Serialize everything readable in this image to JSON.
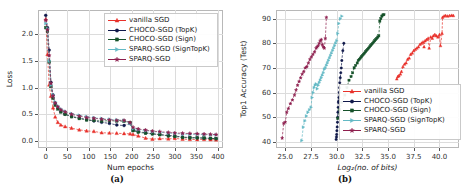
{
  "figure": {
    "panels": [
      {
        "id": "a",
        "caption": "(a)",
        "xlabel": "Num epochs",
        "ylabel": "Loss",
        "xticks": [
          "0",
          "50",
          "100",
          "150",
          "200",
          "250",
          "300",
          "350",
          "400"
        ],
        "yticks": [
          "0.0",
          "0.5",
          "1.0",
          "1.5",
          "2.0"
        ],
        "legend_position": "upper-right"
      },
      {
        "id": "b",
        "caption": "(b)",
        "xlabel": "Log₂(no. of bits)",
        "ylabel": "Top1 Accuracy (Test)",
        "xticks": [
          "25.0",
          "27.5",
          "30.0",
          "32.5",
          "35.0",
          "37.5",
          "40.0"
        ],
        "yticks": [
          "40",
          "50",
          "60",
          "70",
          "80",
          "90"
        ],
        "legend_position": "lower-right"
      }
    ],
    "legend": [
      {
        "label": "vanilla SGD",
        "color": "#e8312a",
        "marker": "triangle-up"
      },
      {
        "label": "CHOCO-SGD (TopK)",
        "color": "#10184a",
        "marker": "circle"
      },
      {
        "label": "CHOCO-SGD (Sign)",
        "color": "#16522a",
        "marker": "square"
      },
      {
        "label": "SPARQ-SGD (SignTopK)",
        "color": "#63b9c4",
        "marker": "triangle-right"
      },
      {
        "label": "SPARQ-SGD",
        "color": "#8e1f4e",
        "marker": "star"
      }
    ]
  },
  "chart_data": [
    {
      "type": "line",
      "panel": "a",
      "title": "",
      "xlabel": "Num epochs",
      "ylabel": "Loss",
      "xlim": [
        -18,
        412
      ],
      "ylim": [
        -0.13,
        2.45
      ],
      "xticks": [
        0,
        50,
        100,
        150,
        200,
        250,
        300,
        350,
        400
      ],
      "yticks": [
        0.0,
        0.5,
        1.0,
        1.5,
        2.0
      ],
      "grid": true,
      "legend_position": "upper right",
      "series": [
        {
          "name": "vanilla SGD",
          "color": "#e8312a",
          "marker": "triangle-up",
          "x": [
            0,
            4,
            8,
            12,
            17,
            22,
            28,
            35,
            45,
            60,
            78,
            95,
            112,
            130,
            148,
            165,
            182,
            196,
            203,
            215,
            232,
            248,
            265,
            285,
            300,
            318,
            335,
            352,
            368,
            383,
            396
          ],
          "y": [
            2.28,
            1.62,
            1.05,
            0.84,
            0.62,
            0.45,
            0.35,
            0.3,
            0.27,
            0.24,
            0.21,
            0.19,
            0.18,
            0.155,
            0.15,
            0.145,
            0.14,
            0.135,
            0.125,
            0.095,
            0.055,
            0.035,
            0.045,
            0.04,
            0.05,
            0.035,
            0.03,
            0.028,
            0.03,
            0.025,
            0.022
          ]
        },
        {
          "name": "CHOCO-SGD (TopK)",
          "color": "#10184a",
          "marker": "circle",
          "x": [
            0,
            4,
            8,
            12,
            17,
            22,
            28,
            35,
            45,
            60,
            78,
            95,
            112,
            130,
            148,
            165,
            182,
            196,
            203,
            215,
            232,
            248,
            265,
            285,
            300,
            318,
            335,
            352,
            368,
            383,
            396
          ],
          "y": [
            2.35,
            2.12,
            1.7,
            1.1,
            0.86,
            0.7,
            0.62,
            0.55,
            0.5,
            0.46,
            0.43,
            0.4,
            0.375,
            0.35,
            0.33,
            0.3,
            0.29,
            0.33,
            0.205,
            0.175,
            0.155,
            0.135,
            0.12,
            0.105,
            0.095,
            0.075,
            0.065,
            0.06,
            0.055,
            0.05,
            0.045
          ]
        },
        {
          "name": "CHOCO-SGD (Sign)",
          "color": "#16522a",
          "marker": "square",
          "x": [
            0,
            4,
            8,
            12,
            17,
            22,
            28,
            35,
            45,
            60,
            78,
            95,
            112,
            130,
            148,
            165,
            182,
            196,
            203,
            215,
            232,
            248,
            265,
            285,
            300,
            318,
            335,
            352,
            368,
            383,
            396
          ],
          "y": [
            2.12,
            2.05,
            1.48,
            1.02,
            0.8,
            0.67,
            0.6,
            0.545,
            0.5,
            0.455,
            0.42,
            0.395,
            0.385,
            0.375,
            0.38,
            0.375,
            0.37,
            0.345,
            0.195,
            0.165,
            0.145,
            0.135,
            0.12,
            0.095,
            0.085,
            0.065,
            0.06,
            0.06,
            0.055,
            0.05,
            0.045
          ]
        },
        {
          "name": "SPARQ-SGD (SignTopK)",
          "color": "#63b9c4",
          "marker": "triangle-right",
          "x": [
            0,
            4,
            8,
            12,
            17,
            22,
            28,
            35,
            45,
            60,
            78,
            95,
            112,
            130,
            148,
            165,
            182,
            196,
            203,
            215,
            232,
            248,
            265,
            285,
            300,
            318,
            335,
            352,
            368,
            383,
            396
          ],
          "y": [
            2.2,
            2.1,
            1.5,
            1.05,
            0.86,
            0.73,
            0.655,
            0.6,
            0.555,
            0.51,
            0.48,
            0.455,
            0.435,
            0.42,
            0.405,
            0.395,
            0.385,
            0.33,
            0.235,
            0.215,
            0.195,
            0.175,
            0.165,
            0.15,
            0.14,
            0.13,
            0.125,
            0.125,
            0.12,
            0.115,
            0.115
          ]
        },
        {
          "name": "SPARQ-SGD",
          "color": "#8e1f4e",
          "marker": "star",
          "x": [
            0,
            4,
            8,
            12,
            17,
            22,
            28,
            35,
            45,
            60,
            78,
            95,
            112,
            130,
            148,
            165,
            182,
            196,
            203,
            215,
            232,
            248,
            265,
            285,
            300,
            318,
            335,
            352,
            368,
            383,
            396
          ],
          "y": [
            2.26,
            2.08,
            1.6,
            1.08,
            0.84,
            0.71,
            0.64,
            0.585,
            0.545,
            0.5,
            0.465,
            0.44,
            0.425,
            0.41,
            0.395,
            0.385,
            0.385,
            0.345,
            0.255,
            0.225,
            0.205,
            0.185,
            0.175,
            0.16,
            0.15,
            0.145,
            0.14,
            0.135,
            0.13,
            0.125,
            0.12
          ]
        }
      ]
    },
    {
      "type": "scatter",
      "panel": "b",
      "title": "",
      "xlabel": "Log₂(no. of bits)",
      "ylabel": "Top1 Accuracy (Test)",
      "xlim": [
        24.1,
        41.9
      ],
      "ylim": [
        37.5,
        93.5
      ],
      "xticks": [
        25.0,
        27.5,
        30.0,
        32.5,
        35.0,
        37.5,
        40.0
      ],
      "yticks": [
        40,
        50,
        60,
        70,
        80,
        90
      ],
      "grid": true,
      "legend_position": "lower right",
      "series": [
        {
          "name": "vanilla SGD",
          "color": "#e8312a",
          "marker": "triangle-up",
          "x": [
            35.85,
            35.95,
            36.05,
            36.2,
            36.3,
            36.45,
            36.6,
            36.75,
            36.9,
            37.05,
            37.2,
            37.35,
            37.5,
            37.65,
            37.8,
            37.95,
            38.1,
            38.25,
            38.4,
            38.5,
            38.6,
            38.75,
            38.9,
            39.0,
            39.15,
            39.3,
            39.4,
            39.55,
            39.7,
            39.85,
            40.0,
            40.1,
            40.25,
            40.3,
            40.45,
            40.6,
            40.8,
            41.0,
            41.2,
            41.35
          ],
          "y": [
            65.5,
            66.5,
            66.8,
            67.5,
            68.5,
            70.5,
            71.5,
            72.0,
            73.5,
            74.0,
            75.5,
            76.0,
            77.0,
            77.5,
            78.0,
            78.5,
            79.5,
            80.0,
            80.5,
            78.5,
            81.0,
            81.5,
            82.0,
            78.0,
            82.5,
            82.0,
            83.0,
            83.5,
            83.0,
            82.5,
            83.5,
            79.0,
            84.0,
            90.5,
            91.0,
            91.2,
            91.0,
            91.2,
            91.3,
            91.2
          ]
        },
        {
          "name": "CHOCO-SGD (TopK)",
          "color": "#10184a",
          "marker": "circle",
          "x": [
            29.95,
            29.98,
            30.0,
            30.02,
            30.05,
            30.08,
            30.1,
            30.12,
            30.15,
            30.18,
            30.2,
            30.22,
            30.25,
            30.28,
            30.3,
            30.35,
            30.4,
            30.45,
            30.5,
            30.6,
            30.7
          ],
          "y": [
            41.0,
            42.0,
            43.0,
            44.5,
            46.0,
            48.0,
            50.0,
            52.0,
            54.0,
            56.0,
            56.5,
            58.0,
            60.0,
            62.0,
            64.0,
            66.0,
            68.0,
            70.0,
            73.0,
            77.0,
            80.0
          ]
        },
        {
          "name": "CHOCO-SGD (Sign)",
          "color": "#16522a",
          "marker": "square",
          "x": [
            30.1,
            30.3,
            30.5,
            30.8,
            31.0,
            31.2,
            31.4,
            31.55,
            31.7,
            31.85,
            32.0,
            32.1,
            32.2,
            32.3,
            32.4,
            32.5,
            32.6,
            32.7,
            32.8,
            32.9,
            33.0,
            33.1,
            33.2,
            33.3,
            33.4,
            33.5,
            33.6,
            33.7,
            33.8,
            33.9,
            34.0,
            34.1,
            34.2,
            34.3,
            34.4,
            34.5,
            34.6
          ],
          "y": [
            49.5,
            53.0,
            56.0,
            59.0,
            62.0,
            65.0,
            66.5,
            68.0,
            70.0,
            71.0,
            72.0,
            73.0,
            73.5,
            74.0,
            74.5,
            75.0,
            75.5,
            76.0,
            76.5,
            77.0,
            77.5,
            78.0,
            78.5,
            79.0,
            79.5,
            80.0,
            80.5,
            81.0,
            81.5,
            82.0,
            82.5,
            83.0,
            89.0,
            90.0,
            91.0,
            91.5,
            91.6
          ]
        },
        {
          "name": "SPARQ-SGD (SignTopK)",
          "color": "#63b9c4",
          "marker": "triangle-right",
          "x": [
            26.6,
            26.75,
            26.9,
            27.05,
            27.2,
            27.35,
            27.5,
            27.6,
            27.7,
            27.8,
            27.9,
            28.0,
            28.1,
            28.2,
            28.3,
            28.4,
            28.5,
            28.6,
            28.7,
            28.8,
            28.9,
            29.0,
            29.1,
            29.2,
            29.3,
            29.4,
            29.5,
            29.6,
            29.7,
            29.8,
            29.9,
            30.0,
            30.1,
            30.2,
            30.35,
            30.5
          ],
          "y": [
            40.5,
            46.0,
            48.5,
            50.5,
            52.0,
            53.0,
            54.0,
            58.0,
            60.0,
            62.0,
            63.0,
            63.5,
            61.5,
            63.0,
            64.0,
            65.0,
            66.0,
            67.0,
            68.0,
            69.5,
            70.0,
            71.0,
            72.0,
            73.0,
            74.0,
            75.0,
            76.0,
            77.0,
            78.0,
            79.0,
            80.0,
            81.0,
            84.0,
            88.0,
            90.0,
            91.0
          ]
        },
        {
          "name": "SPARQ-SGD",
          "color": "#8e1f4e",
          "marker": "star",
          "x": [
            24.7,
            24.85,
            25.0,
            25.15,
            25.3,
            25.5,
            25.7,
            25.9,
            26.05,
            26.2,
            26.35,
            26.5,
            26.65,
            26.8,
            26.95,
            27.1,
            27.25,
            27.4,
            27.55,
            27.7,
            27.85,
            28.0,
            28.1,
            28.2,
            28.3,
            28.4,
            28.5,
            28.6,
            28.7,
            28.8,
            28.9,
            29.0
          ],
          "y": [
            41.5,
            47.5,
            48.0,
            52.0,
            53.5,
            55.5,
            57.0,
            59.0,
            61.0,
            63.0,
            64.5,
            66.0,
            67.5,
            68.5,
            70.0,
            70.5,
            72.0,
            73.5,
            74.5,
            75.5,
            76.5,
            78.0,
            78.5,
            79.0,
            80.0,
            81.0,
            81.5,
            79.5,
            78.5,
            78.0,
            82.0,
            90.5
          ]
        }
      ]
    }
  ]
}
